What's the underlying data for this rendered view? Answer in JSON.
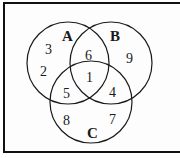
{
  "diagram": {
    "type": "venn-3",
    "sets": [
      {
        "id": "A",
        "label": "A",
        "cx": 68,
        "cy": 63,
        "r": 41
      },
      {
        "id": "B",
        "label": "B",
        "cx": 111,
        "cy": 63,
        "r": 41
      },
      {
        "id": "C",
        "label": "C",
        "cx": 91,
        "cy": 102,
        "r": 41
      }
    ],
    "regions": {
      "A_only": [
        "3",
        "2"
      ],
      "B_only": [
        "9"
      ],
      "C_only": [
        "8",
        "7"
      ],
      "A_and_B": "6",
      "A_and_C": "5",
      "B_and_C": "4",
      "A_and_B_and_C": "1"
    },
    "labels": {
      "A": "A",
      "B": "B",
      "C": "C",
      "a1": "3",
      "a2": "2",
      "b1": "9",
      "c1": "8",
      "c2": "7",
      "ab": "6",
      "ac": "5",
      "bc": "4",
      "abc": "1"
    },
    "colors": {
      "stroke": "#1a1a1a",
      "background": "#ffffff"
    }
  }
}
